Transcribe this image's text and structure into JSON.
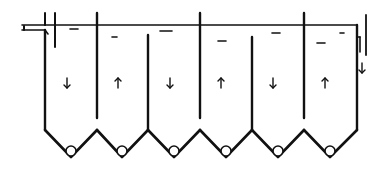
{
  "diagram": {
    "type": "baffled-settling-tank",
    "colors": {
      "line": "#111111",
      "background": "#ffffff"
    },
    "water_surface": {
      "y": 25,
      "x_start": 45,
      "x_end": 357
    },
    "outer_walls": {
      "left_x": 45,
      "right_x": 357,
      "bottom_y": 130
    },
    "baffles": [
      {
        "x": 97,
        "kind": "hanging",
        "y_top": 13,
        "y_bottom": 118
      },
      {
        "x": 148,
        "kind": "rising",
        "y_top": 35,
        "y_bottom": 130
      },
      {
        "x": 200,
        "kind": "hanging",
        "y_top": 13,
        "y_bottom": 118
      },
      {
        "x": 252,
        "kind": "rising",
        "y_top": 37,
        "y_bottom": 130
      },
      {
        "x": 304,
        "kind": "hanging",
        "y_top": 13,
        "y_bottom": 118
      }
    ],
    "chambers": [
      {
        "index": 1,
        "flow": "down",
        "arrow": "↓",
        "arrow_x": 67,
        "arrow_y": 83
      },
      {
        "index": 2,
        "flow": "up",
        "arrow": "↑",
        "arrow_x": 118,
        "arrow_y": 83
      },
      {
        "index": 3,
        "flow": "down",
        "arrow": "↓",
        "arrow_x": 170,
        "arrow_y": 83
      },
      {
        "index": 4,
        "flow": "up",
        "arrow": "↑",
        "arrow_x": 221,
        "arrow_y": 83
      },
      {
        "index": 5,
        "flow": "down",
        "arrow": "↓",
        "arrow_x": 273,
        "arrow_y": 83
      },
      {
        "index": 6,
        "flow": "up",
        "arrow": "↑",
        "arrow_x": 325,
        "arrow_y": 83
      }
    ],
    "hoppers": [
      {
        "left_x": 45,
        "apex_x": 71,
        "right_x": 97,
        "top_y": 130,
        "bottom_y": 157,
        "outlet_radius": 5
      },
      {
        "left_x": 97,
        "apex_x": 122,
        "right_x": 148,
        "top_y": 130,
        "bottom_y": 157,
        "outlet_radius": 5
      },
      {
        "left_x": 148,
        "apex_x": 174,
        "right_x": 200,
        "top_y": 130,
        "bottom_y": 157,
        "outlet_radius": 5
      },
      {
        "left_x": 200,
        "apex_x": 226,
        "right_x": 252,
        "top_y": 130,
        "bottom_y": 157,
        "outlet_radius": 5
      },
      {
        "left_x": 252,
        "apex_x": 278,
        "right_x": 304,
        "top_y": 130,
        "bottom_y": 157,
        "outlet_radius": 5
      },
      {
        "left_x": 304,
        "apex_x": 330,
        "right_x": 357,
        "top_y": 130,
        "bottom_y": 157,
        "outlet_radius": 5
      }
    ],
    "surface_marks": [
      {
        "x": 70,
        "y": 29,
        "w": 8
      },
      {
        "x": 112,
        "y": 37,
        "w": 5
      },
      {
        "x": 160,
        "y": 31,
        "w": 12
      },
      {
        "x": 218,
        "y": 41,
        "w": 8
      },
      {
        "x": 272,
        "y": 33,
        "w": 8
      },
      {
        "x": 317,
        "y": 43,
        "w": 8
      },
      {
        "x": 340,
        "y": 33,
        "w": 4
      }
    ],
    "inlet": {
      "label": "inlet",
      "pipe_y": 25,
      "pipe_x_start": 22,
      "pipe_x_end": 45,
      "baffle_x": 55
    },
    "outlet": {
      "label": "outlet",
      "arrow": "↓",
      "weir_x": 366,
      "arrow_x": 362,
      "arrow_y": 68
    }
  }
}
